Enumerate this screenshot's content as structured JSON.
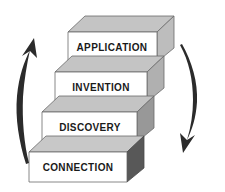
{
  "diagram": {
    "type": "ascending-staircase",
    "background_color": "#ffffff",
    "steps": [
      {
        "index": 0,
        "label": "CONNECTION",
        "level": 1,
        "position": "bottom",
        "face_color": "#ffffff",
        "top_color": "#c8c8c8",
        "side_color": "#585858",
        "outline_color": "#6b6b6b",
        "label_x": 89,
        "label_y": 163,
        "font_size": 10
      },
      {
        "index": 1,
        "label": "DISCOVERY",
        "level": 2,
        "position": "second",
        "face_color": "#ffffff",
        "top_color": "#c4c4c4",
        "side_color": "#989898",
        "outline_color": "#6b6b6b",
        "label_x": 99,
        "label_y": 124,
        "font_size": 10
      },
      {
        "index": 2,
        "label": "INVENTION",
        "level": 3,
        "position": "third",
        "face_color": "#ffffff",
        "top_color": "#c4c4c4",
        "side_color": "#b0b0b0",
        "outline_color": "#6b6b6b",
        "label_x": 109,
        "label_y": 85,
        "font_size": 10
      },
      {
        "index": 3,
        "label": "APPLICATION",
        "level": 4,
        "position": "top",
        "face_color": "#ffffff",
        "top_color": "#c4c4c4",
        "side_color": "#bdbdbd",
        "outline_color": "#6b6b6b",
        "label_x": 119,
        "label_y": 45,
        "font_size": 10
      }
    ],
    "arrows": [
      {
        "name": "ascending-arrow",
        "side": "left",
        "direction": "up",
        "color": "#2b2b2b",
        "meaning": "progression upward through the stages"
      },
      {
        "name": "descending-arrow",
        "side": "right",
        "direction": "down",
        "color": "#2b2b2b",
        "meaning": "feedback returning to the base"
      }
    ]
  }
}
